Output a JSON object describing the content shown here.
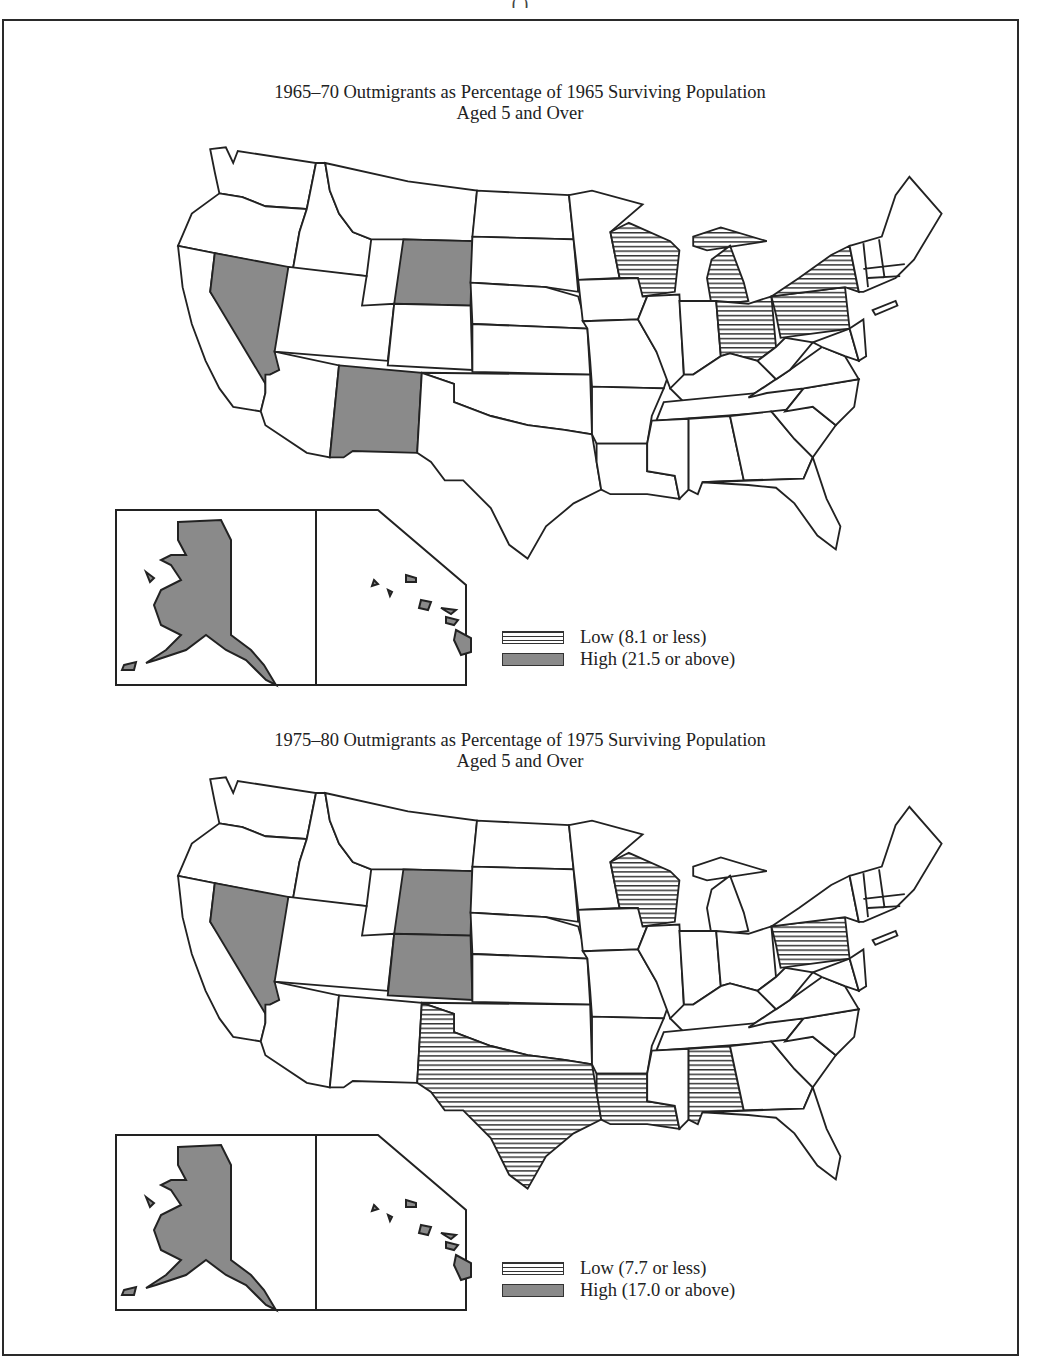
{
  "header_fragment": "( )",
  "legend_colors": {
    "low": "#ffffff-hatched",
    "high": "#8a8a8a",
    "none": "#ffffff",
    "outline": "#222222"
  },
  "panels": [
    {
      "title_line1": "1965–70 Outmigrants as Percentage of 1965 Surviving Population",
      "title_line2": "Aged 5 and Over",
      "legend": [
        {
          "key": "low",
          "label": "Low (8.1 or less)"
        },
        {
          "key": "high",
          "label": "High (21.5 or above)"
        }
      ],
      "low_states": [
        "WI",
        "MI",
        "OH",
        "PA",
        "NY"
      ],
      "high_states": [
        "NV",
        "WY",
        "NM",
        "AK",
        "HI"
      ]
    },
    {
      "title_line1": "1975–80 Outmigrants as Percentage of 1975 Surviving Population",
      "title_line2": "Aged 5 and Over",
      "legend": [
        {
          "key": "low",
          "label": "Low (7.7 or less)"
        },
        {
          "key": "high",
          "label": "High (17.0 or above)"
        }
      ],
      "low_states": [
        "WI",
        "PA",
        "TX",
        "LA",
        "AL"
      ],
      "high_states": [
        "NV",
        "WY",
        "CO",
        "AK",
        "HI"
      ]
    }
  ]
}
